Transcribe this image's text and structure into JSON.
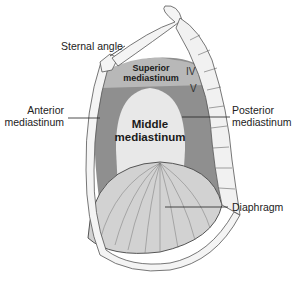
{
  "diagram": {
    "labels": {
      "sternal_angle": "Sternal angle",
      "superior_line1": "Superior",
      "superior_line2": "mediastinum",
      "middle_line1": "Middle",
      "middle_line2": "mediastinum",
      "anterior_line1": "Anterior",
      "anterior_line2": "mediastinum",
      "posterior_line1": "Posterior",
      "posterior_line2": "mediastinum",
      "diaphragm": "Diaphragm",
      "vertebra_iv": "IV",
      "vertebra_v": "V"
    },
    "colors": {
      "superior_region": "#b8b8b8",
      "anterior_posterior_region": "#8f8f8f",
      "middle_region": "#e6e6e6",
      "diaphragm": "#cfcfcf",
      "outline": "#555555",
      "bone": "#f4f4f4"
    }
  }
}
